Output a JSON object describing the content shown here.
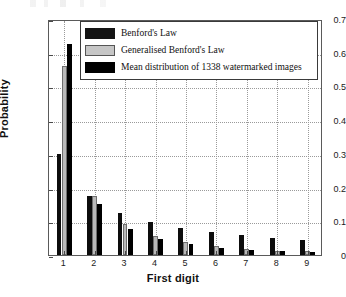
{
  "chart_data": {
    "type": "bar",
    "title": "",
    "xlabel": "First digit",
    "ylabel": "Probability",
    "categories": [
      "1",
      "2",
      "3",
      "4",
      "5",
      "6",
      "7",
      "8",
      "9"
    ],
    "ylim": [
      0,
      0.7
    ],
    "xlim": [
      0.5,
      9.5
    ],
    "ytick_labels": [
      "0",
      "0.1",
      "0.2",
      "0.3",
      "0.4",
      "0.5",
      "0.6",
      "0.7"
    ],
    "ytick_values": [
      0,
      0.1,
      0.2,
      0.3,
      0.4,
      0.5,
      0.6,
      0.7
    ],
    "grid": true,
    "grid_style": "dotted",
    "legend_position": "top-center",
    "series": [
      {
        "name": "Benford's Law",
        "color": "#141414",
        "values": [
          0.301,
          0.176,
          0.125,
          0.097,
          0.079,
          0.067,
          0.058,
          0.051,
          0.046
        ]
      },
      {
        "name": "Generalised Benford's Law",
        "color": "#c6c6c6",
        "values": [
          0.56,
          0.176,
          0.091,
          0.056,
          0.04,
          0.026,
          0.019,
          0.013,
          0.011
        ]
      },
      {
        "name": "Mean distribution of  1338 watermarked images",
        "color": "#000000",
        "values": [
          0.625,
          0.152,
          0.076,
          0.047,
          0.033,
          0.022,
          0.016,
          0.013,
          0.01
        ]
      }
    ]
  }
}
